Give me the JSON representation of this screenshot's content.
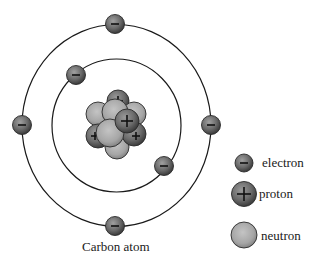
{
  "diagram": {
    "title": "Carbon atom",
    "nucleus": {
      "protons": 6,
      "neutrons": 6
    },
    "shells": [
      {
        "name": "inner",
        "electrons": 2
      },
      {
        "name": "outer",
        "electrons": 4
      }
    ],
    "legend": [
      {
        "key": "electron",
        "label": "electron",
        "symbol": "-",
        "icon": "electron-icon"
      },
      {
        "key": "proton",
        "label": "proton",
        "symbol": "+",
        "icon": "proton-icon"
      },
      {
        "key": "neutron",
        "label": "neutron",
        "symbol": "",
        "icon": "neutron-icon"
      }
    ],
    "colors": {
      "electron_fill": "#6b6b6b",
      "proton_fill": "#6e6e6e",
      "neutron_fill": "#a8a8a8",
      "line": "#1a1a1a"
    }
  }
}
